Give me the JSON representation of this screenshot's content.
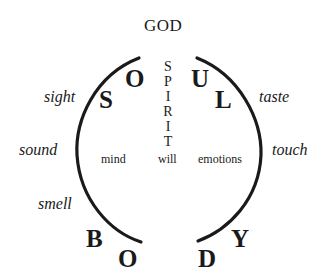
{
  "diagram": {
    "top_label": "GOD",
    "soul_letters": [
      "S",
      "O",
      "U",
      "L"
    ],
    "body_letters": [
      "B",
      "O",
      "D",
      "Y"
    ],
    "spirit_letters": [
      "S",
      "P",
      "I",
      "R",
      "I",
      "T"
    ],
    "faculties": {
      "left": "mind",
      "center": "will",
      "right": "emotions"
    },
    "senses": {
      "left": [
        "sight",
        "sound",
        "smell"
      ],
      "right": [
        "taste",
        "touch"
      ]
    },
    "stroke_color": "#1a1a1a"
  }
}
